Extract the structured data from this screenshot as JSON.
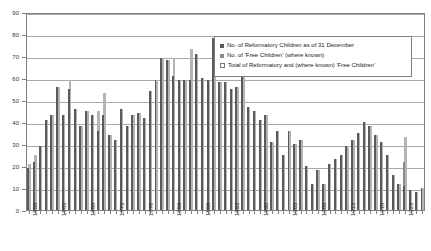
{
  "chart_data": {
    "type": "bar",
    "title": "",
    "xlabel": "",
    "ylabel": "",
    "ylim": [
      0,
      90
    ],
    "ytick_labels": [
      "0",
      "10",
      "20",
      "30",
      "40",
      "50",
      "60",
      "70",
      "80",
      "90"
    ],
    "grid": true,
    "legend_position": "top-right",
    "x": [
      1858,
      1859,
      1860,
      1861,
      1862,
      1863,
      1864,
      1865,
      1866,
      1867,
      1868,
      1869,
      1870,
      1871,
      1872,
      1873,
      1874,
      1875,
      1876,
      1877,
      1878,
      1879,
      1880,
      1881,
      1882,
      1883,
      1884,
      1885,
      1886,
      1887,
      1888,
      1889,
      1890,
      1891,
      1892,
      1893,
      1894,
      1895,
      1896,
      1897,
      1898,
      1899,
      1900,
      1901,
      1902,
      1903,
      1904,
      1905,
      1906,
      1907,
      1908,
      1909,
      1910,
      1911,
      1912,
      1913,
      1914,
      1915,
      1916,
      1917,
      1918,
      1919,
      1920,
      1921,
      1922,
      1923,
      1924,
      1925,
      1926
    ],
    "xtick_labels": [
      "1858",
      "1863",
      "1868",
      "1873",
      "1878",
      "1883",
      "1888",
      "1893",
      "1898",
      "1903",
      "1908",
      "1913",
      "1918",
      "1923"
    ],
    "series": [
      {
        "name": "No. of Reformatory Children as of 31 December",
        "color": "#5a5a5a",
        "values": [
          19,
          22,
          29,
          41,
          43,
          56,
          43,
          55,
          46,
          38,
          45,
          43,
          36,
          43,
          34,
          32,
          46,
          38,
          43,
          44,
          42,
          54,
          59,
          69,
          68,
          61,
          59,
          59,
          59,
          71,
          60,
          59,
          78,
          58,
          58,
          55,
          56,
          69,
          47,
          45,
          41,
          43,
          31,
          36,
          25,
          36,
          30,
          32,
          20,
          12,
          18,
          12,
          21,
          23,
          25,
          29,
          32,
          35,
          40,
          38,
          34,
          31,
          25,
          16,
          12,
          11,
          9,
          8,
          10
        ]
      },
      {
        "name": "No. of 'Free Children' (where known)",
        "color": "#8c8c8c",
        "values": [
          2,
          3,
          0,
          0,
          0,
          0,
          0,
          4,
          0,
          0,
          0,
          0,
          9,
          10,
          0,
          0,
          0,
          0,
          0,
          0,
          0,
          0,
          0,
          0,
          0,
          8,
          0,
          0,
          14,
          0,
          0,
          0,
          0,
          0,
          0,
          0,
          0,
          0,
          0,
          0,
          0,
          0,
          0,
          0,
          0,
          0,
          0,
          0,
          0,
          0,
          0,
          0,
          0,
          0,
          0,
          0,
          0,
          0,
          0,
          0,
          0,
          0,
          0,
          0,
          0,
          22,
          0,
          0,
          0
        ]
      },
      {
        "name": "Total of Reformatory and (where known) 'Free Children'",
        "color": "#b4b4b4",
        "values": [
          21,
          25,
          29,
          41,
          43,
          56,
          43,
          59,
          46,
          38,
          45,
          43,
          45,
          53,
          34,
          32,
          46,
          38,
          43,
          44,
          42,
          54,
          59,
          69,
          68,
          69,
          59,
          59,
          73,
          71,
          60,
          59,
          78,
          58,
          58,
          55,
          56,
          69,
          47,
          45,
          41,
          43,
          31,
          36,
          25,
          36,
          30,
          32,
          20,
          12,
          18,
          12,
          21,
          23,
          25,
          29,
          32,
          35,
          40,
          38,
          34,
          31,
          25,
          16,
          12,
          33,
          9,
          8,
          10
        ]
      }
    ]
  },
  "legend": {
    "items": [
      {
        "label": "No. of Reformatory Children as of 31 December",
        "swatch": "ref"
      },
      {
        "label": "No. of 'Free Children' (where known)",
        "swatch": "free"
      },
      {
        "label": "Total of Reformatory and (where known) 'Free Children'",
        "swatch": "total"
      }
    ]
  }
}
